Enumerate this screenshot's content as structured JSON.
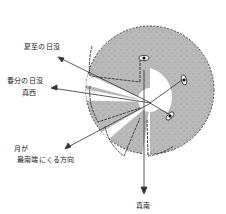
{
  "diagram": {
    "type": "astronomical-alignment-diagram",
    "colors": {
      "disc_fill": "#b9b9b9",
      "disc_edge": "#444444",
      "hollow_fill": "#ffffff",
      "line": "#333333",
      "text": "#222222"
    },
    "labels": {
      "summer_solstice_sunset": "夏至の日没",
      "equinox_sunset_line1": "春分の日没",
      "equinox_sunset_line2": "真西",
      "moon_southernmost_line1": "月が",
      "moon_southernmost_line2": "最南端にくる方向",
      "due_south": "真南"
    },
    "sight_lines": [
      {
        "name": "summer-solstice-sunset",
        "label_key": "summer_solstice_sunset"
      },
      {
        "name": "equinox-sunset-west",
        "label_key": "equinox_sunset_line1"
      },
      {
        "name": "moon-southernmost",
        "label_key": "moon_southernmost_line1"
      },
      {
        "name": "due-south",
        "label_key": "due_south"
      }
    ],
    "icons": [
      "eye-icon",
      "eye-icon",
      "eye-icon"
    ]
  }
}
